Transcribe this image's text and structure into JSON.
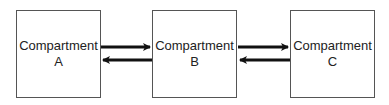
{
  "compartments": [
    {
      "name": "Compartment",
      "letter": "A"
    },
    {
      "name": "Compartment",
      "letter": "B"
    },
    {
      "name": "Compartment",
      "letter": "C"
    }
  ],
  "arrows": [
    {
      "from": "A",
      "to": "B"
    },
    {
      "from": "B",
      "to": "A"
    },
    {
      "from": "B",
      "to": "C"
    },
    {
      "from": "C",
      "to": "B"
    }
  ]
}
